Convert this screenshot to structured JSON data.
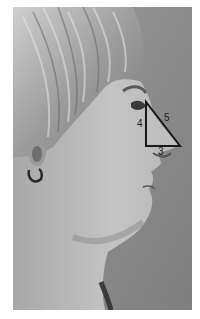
{
  "image": {
    "description": "Grayscale profile photograph of a woman facing right with a right triangle overlaid on the nose",
    "background_color": "#8f8f8f",
    "border_color": "#ffffff"
  },
  "overlay": {
    "shape": "right-triangle",
    "stroke_color": "#1a1a1a",
    "vertices": {
      "top": [
        133,
        95
      ],
      "right_angle": [
        133,
        139
      ],
      "tip": [
        167,
        139
      ]
    },
    "labels": {
      "vertical_side": "4",
      "hypotenuse": "5",
      "horizontal_side": "3"
    }
  }
}
